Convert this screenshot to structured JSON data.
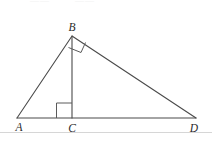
{
  "figure": {
    "canvas": {
      "width": 212,
      "height": 143,
      "background": "#ffffff"
    },
    "stroke_color": "#4a4a4a",
    "label_color": "#2b2b2b",
    "rule_color": "#d6d6d6",
    "vertices": [
      {
        "id": "A",
        "label": "A",
        "x": 17,
        "y": 118,
        "label_x": 19,
        "label_y": 131
      },
      {
        "id": "B",
        "label": "B",
        "x": 72,
        "y": 36,
        "label_x": 72,
        "label_y": 31
      },
      {
        "id": "C",
        "label": "C",
        "x": 72,
        "y": 118,
        "label_x": 72,
        "label_y": 132
      },
      {
        "id": "D",
        "label": "D",
        "x": 196,
        "y": 118,
        "label_x": 194,
        "label_y": 132
      }
    ],
    "segments": [
      {
        "id": "AB",
        "from": "A",
        "to": "B",
        "path": "M 17 118 L 72 36"
      },
      {
        "id": "BD",
        "from": "B",
        "to": "D",
        "path": "M 72 36 L 196 118"
      },
      {
        "id": "AD",
        "from": "A",
        "to": "D",
        "path": "M 17 118 L 196 118"
      },
      {
        "id": "BC",
        "from": "B",
        "to": "C",
        "path": "M 72 37 L 72 118"
      }
    ],
    "right_angle_marks": [
      {
        "id": "right-angle-at-C",
        "at": "C",
        "between": [
          "CA",
          "CB"
        ],
        "path": "M 56 118 L 56 103 L 72 103"
      },
      {
        "id": "right-angle-at-B",
        "at": "B",
        "between": [
          "BC",
          "BD"
        ],
        "path": "M 69 48 L 81 52 L 85 43"
      }
    ],
    "page_rule": {
      "id": "page-rule",
      "path": "M 0 132 L 212 132"
    },
    "ghost_marks": [
      {
        "id": "ghost-top-left",
        "text": "——",
        "x": 30
      },
      {
        "id": "ghost-top-right",
        "text": "——",
        "x": 75
      }
    ]
  }
}
